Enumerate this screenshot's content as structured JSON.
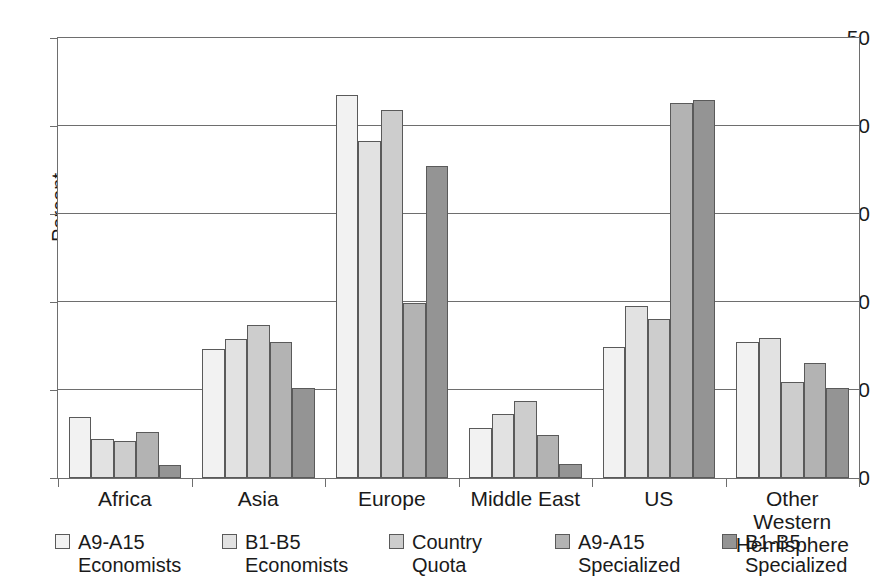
{
  "chart_data": {
    "type": "bar",
    "title": "",
    "xlabel": "",
    "ylabel": "Percent",
    "ylim": [
      0,
      50
    ],
    "yticks": [
      0,
      10,
      20,
      30,
      40,
      50
    ],
    "grid": true,
    "legend_position": "bottom",
    "categories": [
      "Africa",
      "Asia",
      "Europe",
      "Middle East",
      "US",
      "Other Western\nHemisphere"
    ],
    "series": [
      {
        "name": "A9-A15\nEconomists",
        "color": "#f2f2f2",
        "values": [
          6.9,
          14.7,
          43.5,
          5.7,
          14.9,
          15.5
        ]
      },
      {
        "name": "B1-B5\nEconomists",
        "color": "#e2e2e2",
        "values": [
          4.4,
          15.8,
          38.3,
          7.3,
          19.5,
          15.9
        ]
      },
      {
        "name": "Country\nQuota",
        "color": "#cdcdcd",
        "values": [
          4.2,
          17.4,
          41.8,
          8.8,
          18.1,
          10.9
        ]
      },
      {
        "name": "A9-A15\nSpecialized",
        "color": "#b3b3b3",
        "values": [
          5.2,
          15.4,
          19.9,
          4.9,
          42.6,
          13.1
        ]
      },
      {
        "name": "B1-B5\nSpecialized",
        "color": "#949494",
        "values": [
          1.5,
          10.2,
          35.5,
          1.6,
          43.0,
          10.2
        ]
      }
    ]
  },
  "axis": {
    "tick_labels": [
      "50",
      "40",
      "30",
      "20",
      "10",
      "0"
    ],
    "y_title": "Percent"
  }
}
